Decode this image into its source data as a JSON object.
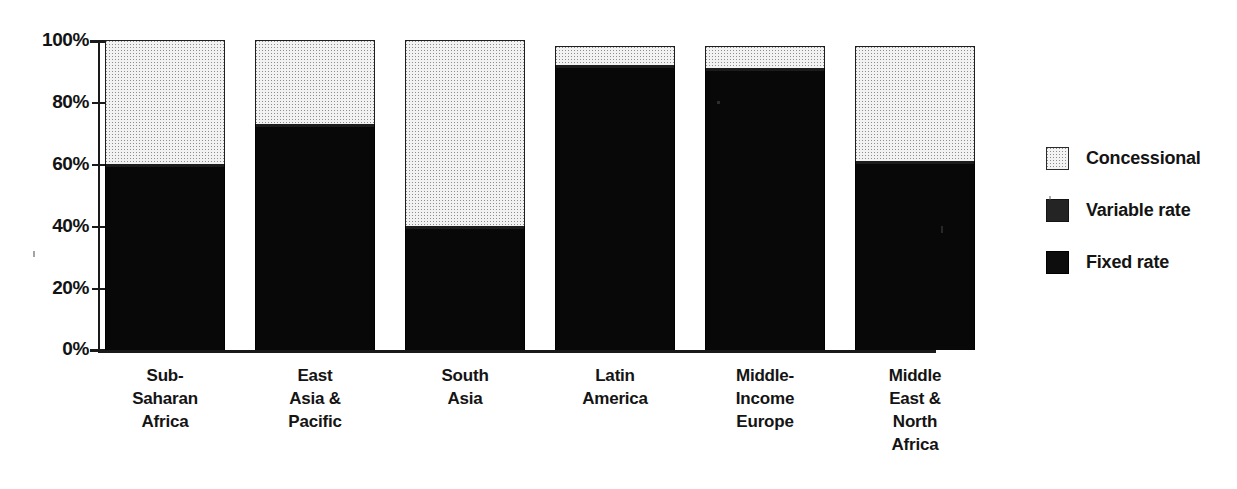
{
  "chart_data": {
    "type": "bar",
    "subtype": "stacked-100-percent",
    "title": "",
    "subtitle": "",
    "xlabel": "",
    "ylabel": "",
    "ylim": [
      0,
      100
    ],
    "y_tick_labels": [
      "0%",
      "20%",
      "40%",
      "60%",
      "80%",
      "100%"
    ],
    "y_tick_values": [
      0,
      20,
      40,
      60,
      80,
      100
    ],
    "grid": false,
    "legend_position": "right",
    "categories": [
      "Sub-Saharan Africa",
      "East Asia & Pacific",
      "South Asia",
      "Latin America",
      "Middle-Income Europe",
      "Middle East & North Africa"
    ],
    "category_label_lines": [
      [
        "Sub-",
        "Saharan",
        "Africa"
      ],
      [
        "East",
        "Asia &",
        "Pacific"
      ],
      [
        "South",
        "Asia"
      ],
      [
        "Latin",
        "America"
      ],
      [
        "Middle-",
        "Income",
        "Europe"
      ],
      [
        "Middle",
        "East &",
        "North",
        "Africa"
      ]
    ],
    "series": [
      {
        "name": "Fixed rate",
        "values": [
          59,
          72,
          39,
          91,
          90,
          60
        ]
      },
      {
        "name": "Variable rate",
        "values": [
          1,
          1,
          1,
          1,
          1,
          1
        ]
      },
      {
        "name": "Concessional",
        "values": [
          40,
          27,
          60,
          6,
          7,
          37
        ]
      }
    ],
    "stack_order_bottom_to_top": [
      "Fixed rate",
      "Variable rate",
      "Concessional"
    ],
    "bar_totals": [
      100,
      100,
      100,
      98,
      98,
      97
    ],
    "colors": {
      "fixed_rate": "#080808",
      "variable_rate": "#1c1c1c",
      "concessional": "#f2f2f2",
      "axis": "#1a1a1a",
      "text": "#141414",
      "background": "#ffffff"
    }
  },
  "axis": {
    "y_labels": [
      "100%",
      "80%",
      "60%",
      "40%",
      "20%",
      "0%"
    ]
  },
  "legend": {
    "items": [
      {
        "label": "Concessional",
        "swatch": "concessional-swatch-icon"
      },
      {
        "label": "Variable rate",
        "swatch": "variable-rate-swatch-icon"
      },
      {
        "label": "Fixed rate",
        "swatch": "fixed-rate-swatch-icon"
      }
    ]
  }
}
